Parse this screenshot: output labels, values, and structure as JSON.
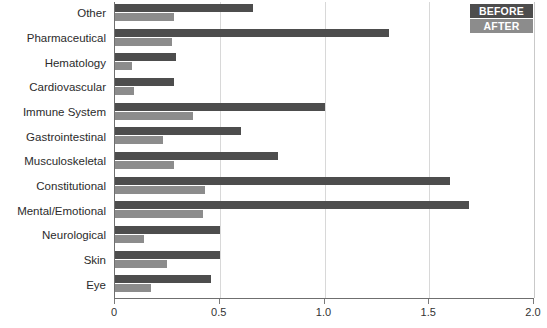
{
  "chart_data": {
    "type": "bar",
    "orientation": "horizontal",
    "title": "",
    "xlabel": "",
    "ylabel": "",
    "xlim": [
      0,
      2.0
    ],
    "xticks": [
      "0",
      "0.5",
      "1.0",
      "1.5",
      "2.0"
    ],
    "xtick_values": [
      0,
      0.5,
      1.0,
      1.5,
      2.0
    ],
    "grid": true,
    "grid_axis": "x",
    "legend_position": "top-right",
    "categories": [
      "Other",
      "Pharmaceutical",
      "Hematology",
      "Cardiovascular",
      "Immune System",
      "Gastrointestinal",
      "Musculoskeletal",
      "Constitutional",
      "Mental/Emotional",
      "Neurological",
      "Skin",
      "Eye"
    ],
    "series": [
      {
        "name": "BEFORE",
        "color": "#4d4d4d",
        "values": [
          0.66,
          1.31,
          0.29,
          0.28,
          1.0,
          0.6,
          0.78,
          1.6,
          1.69,
          0.5,
          0.5,
          0.46
        ]
      },
      {
        "name": "AFTER",
        "color": "#8c8c8c",
        "values": [
          0.28,
          0.27,
          0.08,
          0.09,
          0.37,
          0.23,
          0.28,
          0.43,
          0.42,
          0.14,
          0.25,
          0.17
        ]
      }
    ]
  },
  "legend": {
    "items": [
      {
        "label": "BEFORE",
        "color": "#4d4d4d"
      },
      {
        "label": "AFTER",
        "color": "#8c8c8c"
      }
    ]
  },
  "colors": {
    "before": "#4d4d4d",
    "after": "#8c8c8c",
    "axis": "#6f6f6f",
    "grid": "#d8d8d8",
    "text": "#2b2b2b",
    "background": "#ffffff"
  }
}
